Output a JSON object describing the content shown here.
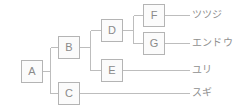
{
  "diagram": {
    "type": "tree",
    "stroke_color": "#bdbdbd",
    "box_border_color": "#b4b4b4",
    "box_fill_color": "#fbfbfb",
    "text_color": "#8a8a8a",
    "label_color": "#8f8f8f",
    "background": "#ffffff",
    "nodes": [
      {
        "id": "A",
        "label": "A",
        "x": 21,
        "y": 60
      },
      {
        "id": "B",
        "label": "B",
        "x": 58,
        "y": 36
      },
      {
        "id": "C",
        "label": "C",
        "x": 58,
        "y": 82
      },
      {
        "id": "D",
        "label": "D",
        "x": 101,
        "y": 19
      },
      {
        "id": "E",
        "label": "E",
        "x": 101,
        "y": 59
      },
      {
        "id": "F",
        "label": "F",
        "x": 143,
        "y": 4
      },
      {
        "id": "G",
        "label": "G",
        "x": 143,
        "y": 32
      }
    ],
    "leaves": [
      {
        "id": "leaf-tsutsuji",
        "label": "ツツジ",
        "from": "F",
        "x": 192,
        "y": 9
      },
      {
        "id": "leaf-endou",
        "label": "エンドウ",
        "from": "G",
        "x": 192,
        "y": 37
      },
      {
        "id": "leaf-yuri",
        "label": "ユリ",
        "from": "E",
        "x": 192,
        "y": 64
      },
      {
        "id": "leaf-sugi",
        "label": "スギ",
        "from": "C",
        "x": 192,
        "y": 87
      }
    ],
    "edges": [
      {
        "from": "A",
        "to": "B"
      },
      {
        "from": "A",
        "to": "C"
      },
      {
        "from": "B",
        "to": "D"
      },
      {
        "from": "B",
        "to": "E"
      },
      {
        "from": "D",
        "to": "F"
      },
      {
        "from": "D",
        "to": "G"
      },
      {
        "from": "F",
        "to": "leaf-tsutsuji"
      },
      {
        "from": "G",
        "to": "leaf-endou"
      },
      {
        "from": "E",
        "to": "leaf-yuri"
      },
      {
        "from": "C",
        "to": "leaf-sugi"
      }
    ]
  }
}
